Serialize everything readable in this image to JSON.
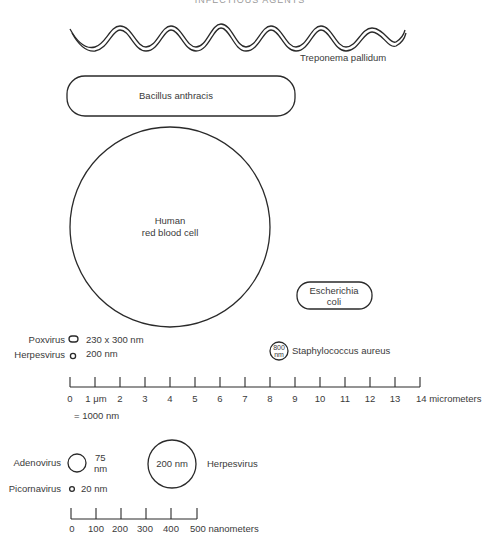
{
  "header": {
    "title": "INFECTIOUS AGENTS"
  },
  "organisms": {
    "treponema": {
      "label": "Treponema pallidum"
    },
    "bacillus": {
      "label": "Bacillus anthracis"
    },
    "rbc": {
      "line1": "Human",
      "line2": "red blood cell"
    },
    "ecoli": {
      "line1": "Escherichia",
      "line2": "coli"
    },
    "poxvirus": {
      "label": "Poxvirus",
      "size": "230 x 300 nm"
    },
    "herpes_small": {
      "label": "Herpesvirus",
      "size": "200 nm"
    },
    "staph": {
      "label": "Staphylococcus aureus",
      "size_top": "800",
      "size_bottom": "nm"
    },
    "adenovirus": {
      "label": "Adenovirus",
      "size_top": "75",
      "size_bottom": "nm"
    },
    "picornavirus": {
      "label": "Picornavirus",
      "size": "20 nm"
    },
    "herpes_large": {
      "label": "Herpesvirus",
      "size": "200 nm"
    }
  },
  "scale_micrometers": {
    "ticks": [
      "0",
      "1 μm",
      "2",
      "3",
      "4",
      "5",
      "6",
      "7",
      "8",
      "9",
      "10",
      "11",
      "12",
      "13",
      "14 micrometers"
    ],
    "note": "= 1000 nm"
  },
  "scale_nanometers": {
    "ticks": [
      "0",
      "100",
      "200",
      "300",
      "400",
      "500 nanometers"
    ]
  }
}
